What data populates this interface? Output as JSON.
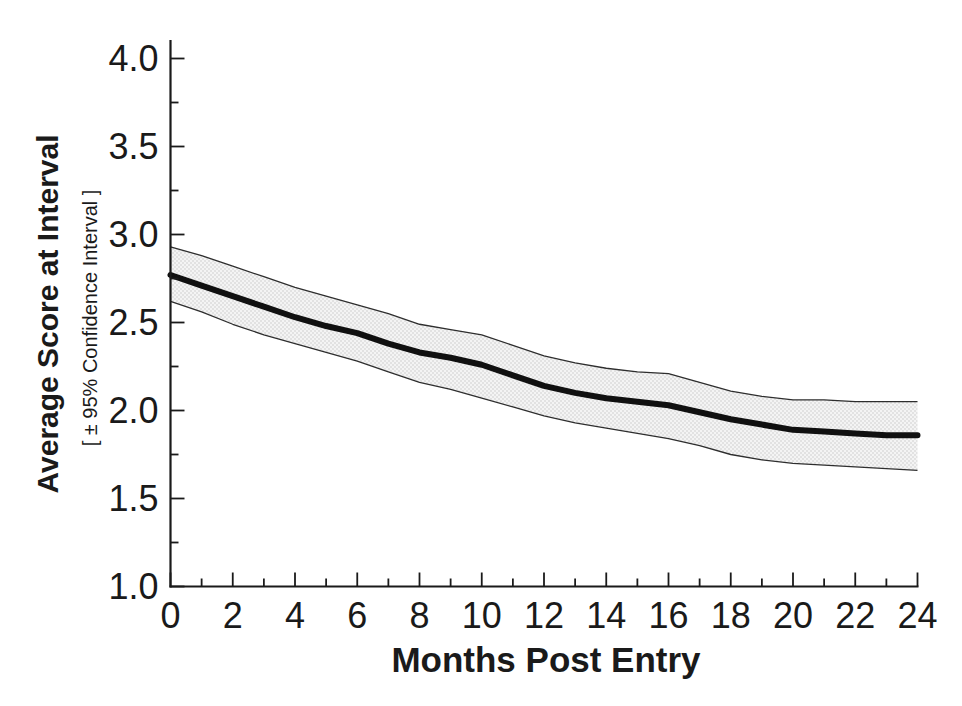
{
  "figure": {
    "background": "#ffffff"
  },
  "chart_data": {
    "type": "line",
    "title": "",
    "xlabel": "Months Post Entry",
    "ylabel": "Average Score at Interval",
    "ylabel_sub": "[ ± 95% Confidence Interval ]",
    "xlim": [
      0,
      24
    ],
    "ylim": [
      1.0,
      4.0
    ],
    "x_major_tick_step": 2,
    "x_minor_tick_step": 1,
    "y_major_tick_step": 0.5,
    "y_minor_tick_step": 0.25,
    "x_tick_labels": [
      "0",
      "2",
      "4",
      "6",
      "8",
      "10",
      "12",
      "14",
      "16",
      "18",
      "20",
      "22",
      "24"
    ],
    "y_tick_labels": [
      "1.0",
      "1.5",
      "2.0",
      "2.5",
      "3.0",
      "3.5",
      "4.0"
    ],
    "grid": "off",
    "legend": "none",
    "x": [
      0,
      1,
      2,
      3,
      4,
      5,
      6,
      7,
      8,
      9,
      10,
      11,
      12,
      13,
      14,
      15,
      16,
      17,
      18,
      19,
      20,
      21,
      22,
      23,
      24
    ],
    "series": [
      {
        "name": "Average Score",
        "role": "mean",
        "values": [
          2.77,
          2.71,
          2.65,
          2.59,
          2.53,
          2.48,
          2.44,
          2.38,
          2.33,
          2.3,
          2.26,
          2.2,
          2.14,
          2.1,
          2.07,
          2.05,
          2.03,
          1.99,
          1.95,
          1.92,
          1.89,
          1.88,
          1.87,
          1.86,
          1.86
        ]
      },
      {
        "name": "Upper 95% Confidence Limit",
        "role": "ci-upper",
        "values": [
          2.93,
          2.88,
          2.82,
          2.76,
          2.7,
          2.65,
          2.6,
          2.55,
          2.49,
          2.46,
          2.43,
          2.37,
          2.31,
          2.27,
          2.24,
          2.22,
          2.21,
          2.16,
          2.11,
          2.08,
          2.06,
          2.06,
          2.05,
          2.05,
          2.05
        ]
      },
      {
        "name": "Lower 95% Confidence Limit",
        "role": "ci-lower",
        "values": [
          2.62,
          2.56,
          2.49,
          2.43,
          2.38,
          2.33,
          2.28,
          2.22,
          2.16,
          2.12,
          2.07,
          2.02,
          1.97,
          1.93,
          1.9,
          1.87,
          1.84,
          1.8,
          1.75,
          1.72,
          1.7,
          1.69,
          1.68,
          1.67,
          1.66
        ]
      }
    ],
    "colors": {
      "mean_line": "#101010",
      "ci_line": "#2e2e2e",
      "band_background": "#f4f4f4",
      "band_dot": "#c2c2c2",
      "text": "#1a1a1a"
    }
  }
}
